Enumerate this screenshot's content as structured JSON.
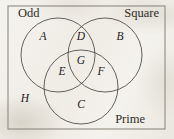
{
  "figure": {
    "kind": "venn-diagram",
    "set_count": 3,
    "background_color": "#f3f1ec",
    "stroke_color": "#4a4742",
    "border_color": "#8e8a82"
  },
  "universe": {
    "name": "universal-set-box",
    "x": 8,
    "y": 6,
    "width": 157,
    "height": 123
  },
  "sets": [
    {
      "id": "odd",
      "label": "Odd",
      "cx": 58,
      "cy": 55,
      "r": 37,
      "label_x": 18,
      "label_y": 17,
      "label_anchor": "start"
    },
    {
      "id": "square",
      "label": "Square",
      "cx": 105,
      "cy": 55,
      "r": 37,
      "label_x": 159,
      "label_y": 17,
      "label_anchor": "end"
    },
    {
      "id": "prime",
      "label": "Prime",
      "cx": 81,
      "cy": 87,
      "r": 37,
      "label_x": 145,
      "label_y": 123,
      "label_anchor": "end"
    }
  ],
  "regions": [
    {
      "id": "A",
      "label": "A",
      "x": 43,
      "y": 37,
      "membership": [
        "Odd"
      ]
    },
    {
      "id": "B",
      "label": "B",
      "x": 120,
      "y": 37,
      "membership": [
        "Square"
      ]
    },
    {
      "id": "C",
      "label": "C",
      "x": 81,
      "y": 105,
      "membership": [
        "Prime"
      ]
    },
    {
      "id": "D",
      "label": "D",
      "x": 81,
      "y": 37,
      "membership": [
        "Odd",
        "Square"
      ]
    },
    {
      "id": "E",
      "label": "E",
      "x": 62,
      "y": 72,
      "membership": [
        "Odd",
        "Prime"
      ]
    },
    {
      "id": "F",
      "label": "F",
      "x": 101,
      "y": 72,
      "membership": [
        "Square",
        "Prime"
      ]
    },
    {
      "id": "G",
      "label": "G",
      "x": 81,
      "y": 61,
      "membership": [
        "Odd",
        "Square",
        "Prime"
      ]
    },
    {
      "id": "H",
      "label": "H",
      "x": 25,
      "y": 99,
      "membership": []
    }
  ]
}
